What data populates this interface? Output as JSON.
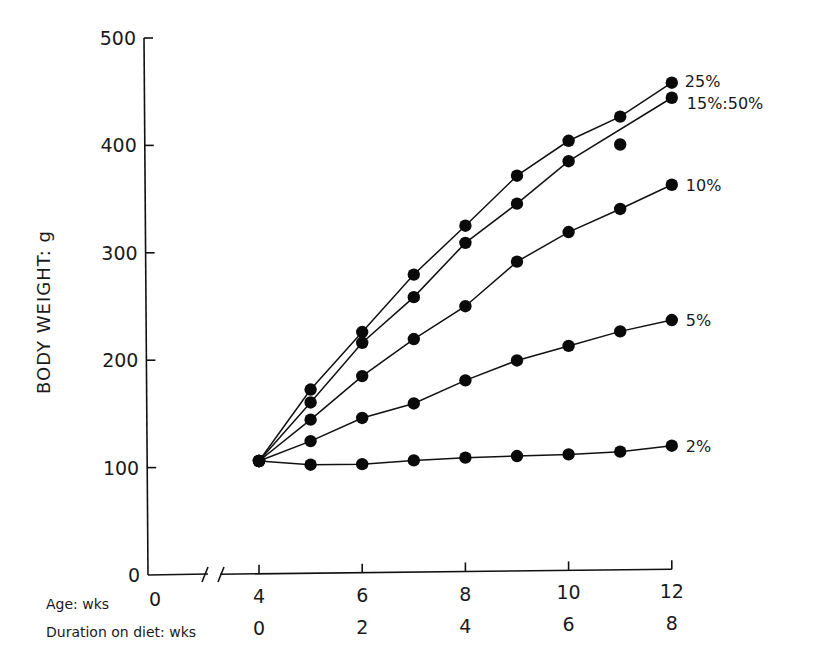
{
  "chart_data": {
    "type": "line",
    "title": "",
    "ylabel": "BODY WEIGHT: g",
    "xlabel_rows": [
      {
        "label": "Age: wks",
        "ticks": [
          "0",
          "4",
          "6",
          "8",
          "10",
          "12"
        ]
      },
      {
        "label": "Duration on diet: wks",
        "ticks": [
          "0",
          "2",
          "4",
          "6",
          "8"
        ]
      }
    ],
    "y_ticks": [
      "0",
      "100",
      "200",
      "300",
      "400",
      "500"
    ],
    "ylim": [
      0,
      500
    ],
    "xlim_age_wks": [
      0,
      12
    ],
    "x_axis_break": true,
    "grid": false,
    "legend": "inline labels at line ends",
    "x": [
      4,
      5,
      6,
      7,
      8,
      9,
      10,
      11,
      12
    ],
    "series": [
      {
        "name": "25%",
        "values": [
          105,
          171,
          224,
          277,
          322,
          368,
          400,
          422,
          453
        ]
      },
      {
        "name": "15%:50%",
        "values": [
          105,
          159,
          214,
          256,
          306,
          342,
          381,
          null,
          439
        ],
        "extra_points": [
          {
            "x": 11,
            "y": 396
          }
        ]
      },
      {
        "name": "10%",
        "values": [
          105,
          143,
          183,
          217,
          247,
          288,
          315,
          336,
          358
        ]
      },
      {
        "name": "5%",
        "values": [
          105,
          123,
          144,
          157,
          178,
          196,
          209,
          222,
          232
        ]
      },
      {
        "name": "2%",
        "values": [
          105,
          101,
          101,
          104,
          106,
          107,
          108,
          110,
          115
        ]
      }
    ]
  }
}
